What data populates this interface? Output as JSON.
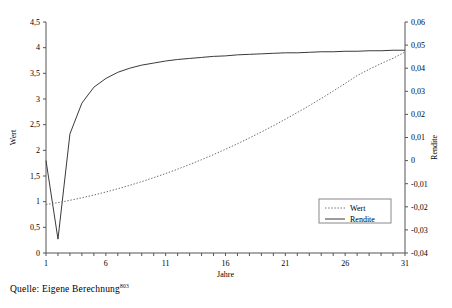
{
  "caption": {
    "text": "Quelle: Eigene Berechnung",
    "footnote_marker": "803"
  },
  "chart_data": {
    "type": "line",
    "title": "",
    "xlabel": "Jahre",
    "ylabel": "Wert",
    "y2label": "Rendite",
    "grid": false,
    "legend_position": "bottom-right",
    "xlim": [
      1,
      31
    ],
    "xticks_labeled": [
      1,
      6,
      11,
      16,
      21,
      26,
      31
    ],
    "xtick_step_minor": 1,
    "ylim": [
      0,
      4.5
    ],
    "yticks": [
      "0",
      "0,5",
      "1",
      "1,5",
      "2",
      "2,5",
      "3",
      "3,5",
      "4",
      "4,5"
    ],
    "ytick_values": [
      0,
      0.5,
      1,
      1.5,
      2,
      2.5,
      3,
      3.5,
      4,
      4.5
    ],
    "y2lim": [
      -0.04,
      0.06
    ],
    "y2ticks": [
      "-0,04",
      "-0,03",
      "-0,02",
      "-0,01",
      "0",
      "0,01",
      "0,02",
      "0,03",
      "0,04",
      "0,05",
      "0,06"
    ],
    "y2tick_values": [
      -0.04,
      -0.03,
      -0.02,
      -0.01,
      0,
      0.01,
      0.02,
      0.03,
      0.04,
      0.05,
      0.06
    ],
    "x": [
      1,
      2,
      3,
      4,
      5,
      6,
      7,
      8,
      9,
      10,
      11,
      12,
      13,
      14,
      15,
      16,
      17,
      18,
      19,
      20,
      21,
      22,
      23,
      24,
      25,
      26,
      27,
      28,
      29,
      30,
      31
    ],
    "series": [
      {
        "name": "Rendite",
        "axis": "left",
        "style": "solid",
        "color": "#3a3a3a",
        "values": [
          1.8,
          0.27,
          2.32,
          2.92,
          3.23,
          3.4,
          3.52,
          3.6,
          3.66,
          3.7,
          3.74,
          3.77,
          3.79,
          3.81,
          3.83,
          3.84,
          3.86,
          3.87,
          3.88,
          3.89,
          3.9,
          3.9,
          3.91,
          3.92,
          3.92,
          3.93,
          3.93,
          3.94,
          3.94,
          3.95,
          3.95
        ]
      },
      {
        "name": "Wert",
        "axis": "right",
        "style": "dotted",
        "color": "#6a6a6a",
        "values": [
          -0.019,
          -0.0182,
          -0.0172,
          -0.0161,
          -0.0149,
          -0.0136,
          -0.0122,
          -0.0107,
          -0.0091,
          -0.0074,
          -0.0056,
          -0.0037,
          -0.0017,
          0.0004,
          0.0026,
          0.0049,
          0.0073,
          0.0098,
          0.0124,
          0.0151,
          0.0179,
          0.0208,
          0.0238,
          0.0269,
          0.0301,
          0.0334,
          0.0368,
          0.0395,
          0.042,
          0.0443,
          0.047
        ]
      }
    ],
    "legend": [
      {
        "label": "Wert",
        "style": "dotted"
      },
      {
        "label": "Rendite",
        "style": "solid"
      }
    ]
  }
}
